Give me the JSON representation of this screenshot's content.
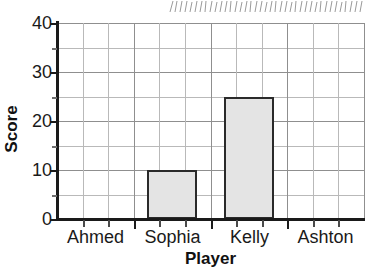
{
  "chart_data": {
    "type": "bar",
    "title": "",
    "subtitle": "",
    "xlabel": "Player",
    "ylabel": "Score",
    "categories": [
      "Ahmed",
      "Sophia",
      "Kelly",
      "Ashton"
    ],
    "values": [
      0,
      10,
      25,
      0
    ],
    "ylim": [
      0,
      40
    ],
    "y_major_ticks": [
      0,
      10,
      20,
      30,
      40
    ],
    "y_minor_ticks": [
      5,
      15,
      25,
      35
    ],
    "y_tick_labels": [
      "0",
      "10",
      "20",
      "30",
      "40"
    ],
    "grid": "both",
    "grid_x_columns": 12,
    "legend": "none",
    "bar_fill_color": "#e4e4e4",
    "bar_edge_color": "#2a2a2a",
    "gridline_color": "#b9b9b9",
    "axis_color": "#1a1a1a",
    "background_color": "#ffffff",
    "annotations": []
  },
  "artifact": {
    "name": "scan-edge-tick-marks",
    "description": "faint hand-drawn tick marks cropped from the page above"
  }
}
